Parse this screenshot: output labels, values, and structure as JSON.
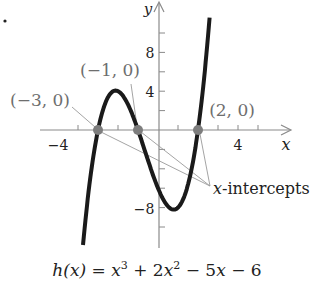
{
  "chart_data": {
    "type": "line",
    "title": "",
    "function_label": "h(x) = x³ + 2x² − 5x − 6",
    "function_parts": {
      "lhs": "h(x) = ",
      "t1": "x",
      "e1": "3",
      "t2": " + 2",
      "t3": "x",
      "e2": "2",
      "t4": " − 5",
      "t5": "x",
      "t6": " − 6"
    },
    "coefficients": [
      1,
      2,
      -5,
      -6
    ],
    "xlabel": "x",
    "ylabel": "y",
    "xlim": [
      -4.6,
      6.6
    ],
    "ylim": [
      -12,
      13
    ],
    "x_ticks": [
      -4,
      -3,
      -2,
      -1,
      0,
      1,
      2,
      3,
      4,
      5
    ],
    "y_ticks": [
      -10,
      -8,
      -6,
      -4,
      -2,
      0,
      2,
      4,
      6,
      8,
      10
    ],
    "x_tick_labels": [
      {
        "value": -4,
        "label": "−4"
      },
      {
        "value": 4,
        "label": "4"
      }
    ],
    "y_tick_labels": [
      {
        "value": 8,
        "label": "8"
      },
      {
        "value": 4,
        "label": "4"
      },
      {
        "value": -8,
        "label": "−8"
      }
    ],
    "x": [
      -3.75,
      -3,
      -2.5,
      -2.12,
      -1.5,
      -1,
      0,
      0.79,
      1.5,
      2,
      2.58
    ],
    "y": [
      -11.92,
      0,
      3.38,
      4.06,
      2.63,
      0,
      -6,
      -8.21,
      -4.69,
      0,
      12
    ],
    "key_points": {
      "local_max": [
        -2.12,
        4.06
      ],
      "local_min": [
        0.79,
        -8.21
      ]
    },
    "x_intercepts": [
      {
        "x": -3,
        "y": 0,
        "label": "(−3, 0)"
      },
      {
        "x": -1,
        "y": 0,
        "label": "(−1, 0)"
      },
      {
        "x": 2,
        "y": 0,
        "label": "(2, 0)"
      }
    ],
    "annotations": [
      {
        "text": "x-intercepts",
        "italic_prefix": "x",
        "rest": "-intercepts"
      }
    ],
    "grid": false,
    "legend": null,
    "colors": {
      "curve": "#1a1a1a",
      "axis": "#8a8a8a",
      "points": "#7d7d7d",
      "leaders": "#9a9a9a",
      "labels": "#6e6e6e",
      "text": "#222222"
    }
  },
  "figure": {
    "marker": "."
  }
}
